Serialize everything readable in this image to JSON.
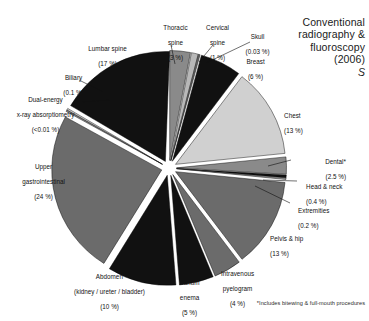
{
  "header": {
    "title_line1": "Conventional",
    "title_line2": "radiography &",
    "title_line3": "fluoroscopy",
    "title_line4": "(2006)",
    "title_mark": "S"
  },
  "footnote": "*Includes bitewing & full-mouth procedures",
  "chart_data": {
    "type": "pie",
    "title": "Conventional radiography & fluoroscopy (2006)",
    "subtitle": "S",
    "footnote": "*Includes bitewing & full-mouth procedures",
    "units": "percent of examinations",
    "legend": "none (direct callout labels)",
    "exploded": true,
    "categories": [
      "Thoracic spine",
      "Cervical spine",
      "Skull",
      "Breast",
      "Chest",
      "Dental*",
      "Head & neck",
      "Extremities",
      "Pelvis & hip",
      "Intravenous pyelogram",
      "Barium enema",
      "Abdomen (kidney / ureter / bladder)",
      "Upper gastrointestinal",
      "Dual-energy x-ray absorptiometry",
      "Biliary",
      "Lumbar spine"
    ],
    "values": [
      3,
      1,
      0.03,
      6,
      13,
      2.5,
      0.4,
      0.2,
      13,
      4,
      5,
      10,
      24,
      0.01,
      0.1,
      17
    ],
    "value_labels": [
      "(3 %)",
      "(1 %)",
      "(0.03 %)",
      "(6 %)",
      "(13 %)",
      "(2.5 %)",
      "(0.4 %)",
      "(0.2 %)",
      "(13 %)",
      "(4 %)",
      "(5 %)",
      "(10 %)",
      "(24 %)",
      "(<0.01 %)",
      "(0.1 %)",
      "(17 %)"
    ],
    "colors": [
      "#8a8a8a",
      "#b8b8b8",
      "#6e6e6e",
      "#111111",
      "#d0d0d0",
      "#8a8a8a",
      "#111111",
      "#9a9a9a",
      "#6b6b6b",
      "#6b6b6b",
      "#111111",
      "#111111",
      "#6b6b6b",
      "#8a8a8a",
      "#d0d0d0",
      "#111111"
    ]
  },
  "slices": [
    {
      "name": "thoracic-spine",
      "label_line1": "Thoracic",
      "label_line2": "spine",
      "label_line3": "(3 %)"
    },
    {
      "name": "cervical-spine",
      "label_line1": "Cervical",
      "label_line2": "spine",
      "label_line3": "(1 %)"
    },
    {
      "name": "skull",
      "label_line1": "Skull",
      "label_line2": "(0.03 %)"
    },
    {
      "name": "breast",
      "label_line1": "Breast",
      "label_line2": "(6 %)"
    },
    {
      "name": "chest",
      "label_line1": "Chest",
      "label_line2": "(13 %)"
    },
    {
      "name": "dental",
      "label_line1": "Dental*",
      "label_line2": "(2.5 %)"
    },
    {
      "name": "head-and-neck",
      "label_line1": "Head & neck",
      "label_line2": "(0.4 %)"
    },
    {
      "name": "extremities",
      "label_line1": "Extremities",
      "label_line2": "(0.2 %)"
    },
    {
      "name": "pelvis-and-hip",
      "label_line1": "Pelvis & hip",
      "label_line2": "(13 %)"
    },
    {
      "name": "intravenous-pyelogram",
      "label_line1": "Intravenous",
      "label_line2": "pyelogram",
      "label_line3": "(4 %)"
    },
    {
      "name": "barium-enema",
      "label_line1": "Barium",
      "label_line2": "enema",
      "label_line3": "(5 %)"
    },
    {
      "name": "abdomen",
      "label_line1": "Abdomen",
      "label_line2": "(kidney / ureter / bladder)",
      "label_line3": "(10 %)"
    },
    {
      "name": "upper-gastrointestinal",
      "label_line1": "Upper",
      "label_line2": "gastrointestinal",
      "label_line3": "(24 %)"
    },
    {
      "name": "dxa",
      "label_line1": "Dual-energy",
      "label_line2": "x-ray absorptiometry",
      "label_line3": "(<0.01 %)"
    },
    {
      "name": "biliary",
      "label_line1": "Biliary",
      "label_line2": "(0.1 %)"
    },
    {
      "name": "lumbar-spine",
      "label_line1": "Lumbar spine",
      "label_line2": "(17 %)"
    }
  ]
}
